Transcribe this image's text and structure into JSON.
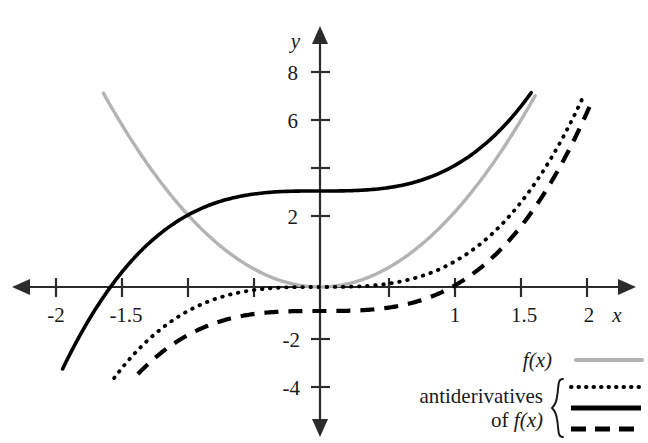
{
  "figure": {
    "axis_x_name": "x",
    "axis_y_name": "y",
    "background": "#ffffff"
  },
  "legend": {
    "f_label": "f(x)",
    "anti_line1": "antiderivatives",
    "anti_line2_prefix": "of ",
    "anti_line2_fn": "f(x)",
    "f_color": "#b3b3b3",
    "anti_color": "#000000"
  },
  "chart_data": {
    "type": "line",
    "title": "",
    "xlabel": "x",
    "ylabel": "y",
    "xlim": [
      -2.15,
      2.2
    ],
    "ylim": [
      -4.9,
      8.8
    ],
    "grid": false,
    "legend_position": "bottom-right",
    "x_ticks": [
      -2,
      -1.5,
      -1,
      -0.5,
      0.5,
      1,
      1.5,
      2
    ],
    "x_tick_labels": [
      "-2",
      "-1.5",
      "",
      "",
      "",
      "1",
      "1.5",
      "2"
    ],
    "y_ticks": [
      8,
      6,
      4,
      2,
      -2,
      -4
    ],
    "y_tick_labels": [
      "8",
      "6",
      "",
      "2",
      "-2",
      "-4"
    ],
    "series": [
      {
        "name": "f(x)",
        "style": "solid-gray",
        "color": "#b3b3b3",
        "expression": "3x^2",
        "x_range": [
          -1.64,
          1.63
        ],
        "x": [
          -1.64,
          -1.5,
          -1.25,
          -1.0,
          -0.75,
          -0.5,
          -0.25,
          0,
          0.25,
          0.5,
          0.75,
          1.0,
          1.25,
          1.5,
          1.63
        ],
        "values": [
          8.07,
          6.75,
          4.69,
          3.0,
          1.69,
          0.75,
          0.19,
          0,
          0.19,
          0.75,
          1.69,
          3.0,
          4.69,
          6.75,
          7.97
        ]
      },
      {
        "name": "antiderivative C=4",
        "style": "solid-black",
        "color": "#000000",
        "expression": "x^3 + 4",
        "x_range": [
          -1.95,
          1.6
        ],
        "x": [
          -1.95,
          -1.75,
          -1.5,
          -1.25,
          -1.0,
          -0.75,
          -0.5,
          -0.25,
          0,
          0.25,
          0.5,
          0.75,
          1.0,
          1.25,
          1.5,
          1.6
        ],
        "values": [
          -3.41,
          -1.36,
          0.63,
          2.05,
          3.0,
          3.58,
          3.88,
          3.98,
          4.0,
          4.02,
          4.13,
          4.42,
          5.0,
          5.95,
          7.38,
          8.1
        ]
      },
      {
        "name": "antiderivative C=0",
        "style": "dotted",
        "color": "#000000",
        "expression": "x^3",
        "x_range": [
          -1.56,
          2.0
        ],
        "x": [
          -1.56,
          -1.25,
          -1.0,
          -0.75,
          -0.5,
          -0.25,
          0,
          0.25,
          0.5,
          0.75,
          1.0,
          1.25,
          1.5,
          1.75,
          2.0
        ],
        "values": [
          -3.8,
          -1.95,
          -1.0,
          -0.42,
          -0.13,
          -0.02,
          0,
          0.02,
          0.13,
          0.42,
          1.0,
          1.95,
          3.38,
          5.36,
          8.0
        ]
      },
      {
        "name": "antiderivative C=-1",
        "style": "dashed",
        "color": "#000000",
        "expression": "x^3 - 1",
        "x_range": [
          -1.38,
          2.05
        ],
        "x": [
          -1.38,
          -1.25,
          -1.0,
          -0.75,
          -0.5,
          -0.25,
          0,
          0.25,
          0.5,
          0.75,
          1.0,
          1.25,
          1.5,
          1.75,
          2.0,
          2.05
        ],
        "values": [
          -3.63,
          -2.95,
          -2.0,
          -1.42,
          -1.13,
          -1.02,
          -1.0,
          -0.98,
          -0.88,
          -0.58,
          0,
          0.95,
          2.38,
          4.36,
          7.0,
          7.62
        ]
      }
    ]
  }
}
